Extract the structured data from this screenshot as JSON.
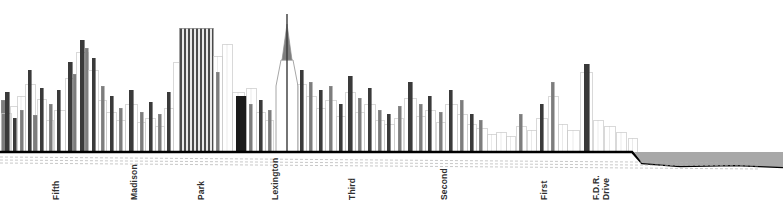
{
  "figure": {
    "width": 783,
    "height": 221,
    "background_color": "#ffffff"
  },
  "colors": {
    "outline_light": "#c9c9c9",
    "outline_mid": "#8f8f8f",
    "fill_dark": "#3a3a3a",
    "fill_black": "#1a1a1a",
    "fill_mid_gray": "#7d7d7d",
    "fill_light_gray": "#d6d6d6",
    "ground_line": "#000000",
    "water_fill": "#a8a8a8",
    "dashed_line": "#b0b0b0",
    "label_text": "#303030"
  },
  "ground": {
    "baseline_y": 152,
    "label_y": 200,
    "water_top_y": 152,
    "water_start_x": 640
  },
  "street_labels": [
    {
      "name": "Fifth",
      "lines": [
        "Fifth"
      ],
      "x": 52,
      "y": 200
    },
    {
      "name": "Madison",
      "lines": [
        "Madison"
      ],
      "x": 130,
      "y": 200
    },
    {
      "name": "Park",
      "lines": [
        "Park"
      ],
      "x": 197,
      "y": 200
    },
    {
      "name": "Lexington",
      "lines": [
        "Lexington"
      ],
      "x": 271,
      "y": 200
    },
    {
      "name": "Third",
      "lines": [
        "Third"
      ],
      "x": 348,
      "y": 200
    },
    {
      "name": "Second",
      "lines": [
        "Second"
      ],
      "x": 440,
      "y": 200
    },
    {
      "name": "First",
      "lines": [
        "First"
      ],
      "x": 540,
      "y": 200
    },
    {
      "name": "F.D.R. Drive",
      "lines": [
        "F.D.R.",
        "Drive"
      ],
      "x": 592,
      "y": 200
    }
  ],
  "chart_data": {
    "type": "bar",
    "subtitle": "Building heights along an east-west section from Fifth Avenue to the East River",
    "xlabel": "Avenue (west to east)",
    "ylabel": "Building height",
    "orientation": "vertical",
    "grid": false,
    "legend": null,
    "xlim": [
      0,
      783
    ],
    "ylim": [
      0,
      152
    ],
    "baseline_y": 152,
    "categories": [
      "Fifth",
      "Madison",
      "Park",
      "Lexington",
      "Third",
      "Second",
      "First",
      "F.D.R. Drive"
    ],
    "category_x": [
      52,
      130,
      197,
      271,
      348,
      440,
      540,
      592
    ],
    "annotations": [
      {
        "label": "East River",
        "x_start": 640,
        "x_end": 783,
        "y_top": 152,
        "fill": "#a8a8a8"
      },
      {
        "label": "Chrysler Building spire",
        "x": 287,
        "peak_y": 14
      },
      {
        "label": "MetLife / Pan Am striped tower",
        "x": 196,
        "peak_y": 28
      }
    ],
    "buildings": [
      {
        "x": 1,
        "w": 5,
        "top": 100,
        "tone": "mid"
      },
      {
        "x": 1,
        "w": 10,
        "top": 113,
        "tone": "light"
      },
      {
        "x": 5,
        "w": 4,
        "top": 92,
        "tone": "dark"
      },
      {
        "x": 10,
        "w": 7,
        "top": 106,
        "tone": "light"
      },
      {
        "x": 13,
        "w": 3,
        "top": 118,
        "tone": "dark"
      },
      {
        "x": 17,
        "w": 8,
        "top": 96,
        "tone": "light"
      },
      {
        "x": 20,
        "w": 3,
        "top": 110,
        "tone": "mid"
      },
      {
        "x": 25,
        "w": 10,
        "top": 84,
        "tone": "light"
      },
      {
        "x": 28,
        "w": 3,
        "top": 70,
        "tone": "dark"
      },
      {
        "x": 33,
        "w": 4,
        "top": 115,
        "tone": "mid"
      },
      {
        "x": 37,
        "w": 9,
        "top": 99,
        "tone": "light"
      },
      {
        "x": 40,
        "w": 3,
        "top": 88,
        "tone": "dark"
      },
      {
        "x": 46,
        "w": 7,
        "top": 120,
        "tone": "light"
      },
      {
        "x": 49,
        "w": 3,
        "top": 104,
        "tone": "mid"
      },
      {
        "x": 54,
        "w": 11,
        "top": 110,
        "tone": "light"
      },
      {
        "x": 57,
        "w": 3,
        "top": 90,
        "tone": "dark"
      },
      {
        "x": 65,
        "w": 9,
        "top": 78,
        "tone": "light"
      },
      {
        "x": 68,
        "w": 4,
        "top": 62,
        "tone": "dark"
      },
      {
        "x": 73,
        "w": 3,
        "top": 74,
        "tone": "mid"
      },
      {
        "x": 76,
        "w": 12,
        "top": 52,
        "tone": "light"
      },
      {
        "x": 80,
        "w": 4,
        "top": 40,
        "tone": "dark"
      },
      {
        "x": 85,
        "w": 3,
        "top": 48,
        "tone": "mid"
      },
      {
        "x": 88,
        "w": 10,
        "top": 70,
        "tone": "light"
      },
      {
        "x": 92,
        "w": 3,
        "top": 58,
        "tone": "dark"
      },
      {
        "x": 98,
        "w": 8,
        "top": 100,
        "tone": "light"
      },
      {
        "x": 101,
        "w": 3,
        "top": 86,
        "tone": "mid"
      },
      {
        "x": 106,
        "w": 10,
        "top": 112,
        "tone": "light"
      },
      {
        "x": 110,
        "w": 3,
        "top": 96,
        "tone": "dark"
      },
      {
        "x": 116,
        "w": 9,
        "top": 120,
        "tone": "light"
      },
      {
        "x": 119,
        "w": 3,
        "top": 108,
        "tone": "mid"
      },
      {
        "x": 125,
        "w": 12,
        "top": 104,
        "tone": "light"
      },
      {
        "x": 129,
        "w": 4,
        "top": 90,
        "tone": "dark"
      },
      {
        "x": 137,
        "w": 8,
        "top": 122,
        "tone": "light"
      },
      {
        "x": 140,
        "w": 3,
        "top": 112,
        "tone": "mid"
      },
      {
        "x": 145,
        "w": 10,
        "top": 118,
        "tone": "light"
      },
      {
        "x": 149,
        "w": 3,
        "top": 102,
        "tone": "dark"
      },
      {
        "x": 155,
        "w": 9,
        "top": 126,
        "tone": "light"
      },
      {
        "x": 158,
        "w": 3,
        "top": 114,
        "tone": "mid"
      },
      {
        "x": 164,
        "w": 9,
        "top": 108,
        "tone": "light"
      },
      {
        "x": 167,
        "w": 3,
        "top": 92,
        "tone": "dark"
      },
      {
        "x": 173,
        "w": 6,
        "top": 62,
        "tone": "light"
      },
      {
        "x": 179,
        "w": 34,
        "top": 28,
        "tone": "striped"
      },
      {
        "x": 213,
        "w": 9,
        "top": 56,
        "tone": "light"
      },
      {
        "x": 216,
        "w": 3,
        "top": 72,
        "tone": "mid"
      },
      {
        "x": 222,
        "w": 10,
        "top": 44,
        "tone": "light"
      },
      {
        "x": 232,
        "w": 12,
        "top": 92,
        "tone": "light"
      },
      {
        "x": 236,
        "w": 10,
        "top": 96,
        "tone": "black"
      },
      {
        "x": 246,
        "w": 10,
        "top": 88,
        "tone": "light"
      },
      {
        "x": 249,
        "w": 3,
        "top": 104,
        "tone": "mid"
      },
      {
        "x": 256,
        "w": 9,
        "top": 112,
        "tone": "light"
      },
      {
        "x": 259,
        "w": 3,
        "top": 100,
        "tone": "dark"
      },
      {
        "x": 265,
        "w": 8,
        "top": 120,
        "tone": "light"
      },
      {
        "x": 268,
        "w": 3,
        "top": 110,
        "tone": "mid"
      },
      {
        "x": 297,
        "w": 9,
        "top": 84,
        "tone": "light"
      },
      {
        "x": 300,
        "w": 3,
        "top": 70,
        "tone": "dark"
      },
      {
        "x": 306,
        "w": 10,
        "top": 96,
        "tone": "light"
      },
      {
        "x": 309,
        "w": 3,
        "top": 82,
        "tone": "mid"
      },
      {
        "x": 316,
        "w": 9,
        "top": 108,
        "tone": "light"
      },
      {
        "x": 319,
        "w": 3,
        "top": 90,
        "tone": "dark"
      },
      {
        "x": 325,
        "w": 11,
        "top": 100,
        "tone": "light"
      },
      {
        "x": 329,
        "w": 3,
        "top": 86,
        "tone": "mid"
      },
      {
        "x": 336,
        "w": 9,
        "top": 116,
        "tone": "light"
      },
      {
        "x": 339,
        "w": 3,
        "top": 104,
        "tone": "dark"
      },
      {
        "x": 345,
        "w": 10,
        "top": 92,
        "tone": "light"
      },
      {
        "x": 348,
        "w": 4,
        "top": 76,
        "tone": "dark"
      },
      {
        "x": 355,
        "w": 9,
        "top": 112,
        "tone": "light"
      },
      {
        "x": 358,
        "w": 3,
        "top": 98,
        "tone": "mid"
      },
      {
        "x": 364,
        "w": 11,
        "top": 104,
        "tone": "light"
      },
      {
        "x": 368,
        "w": 3,
        "top": 88,
        "tone": "dark"
      },
      {
        "x": 375,
        "w": 9,
        "top": 120,
        "tone": "light"
      },
      {
        "x": 378,
        "w": 3,
        "top": 110,
        "tone": "mid"
      },
      {
        "x": 384,
        "w": 10,
        "top": 124,
        "tone": "light"
      },
      {
        "x": 387,
        "w": 3,
        "top": 114,
        "tone": "dark"
      },
      {
        "x": 394,
        "w": 9,
        "top": 118,
        "tone": "light"
      },
      {
        "x": 398,
        "w": 3,
        "top": 106,
        "tone": "mid"
      },
      {
        "x": 404,
        "w": 12,
        "top": 98,
        "tone": "light"
      },
      {
        "x": 408,
        "w": 4,
        "top": 82,
        "tone": "dark"
      },
      {
        "x": 416,
        "w": 9,
        "top": 116,
        "tone": "light"
      },
      {
        "x": 419,
        "w": 3,
        "top": 104,
        "tone": "mid"
      },
      {
        "x": 425,
        "w": 10,
        "top": 110,
        "tone": "light"
      },
      {
        "x": 428,
        "w": 3,
        "top": 96,
        "tone": "dark"
      },
      {
        "x": 436,
        "w": 9,
        "top": 122,
        "tone": "light"
      },
      {
        "x": 439,
        "w": 3,
        "top": 112,
        "tone": "mid"
      },
      {
        "x": 445,
        "w": 12,
        "top": 104,
        "tone": "light"
      },
      {
        "x": 449,
        "w": 3,
        "top": 90,
        "tone": "dark"
      },
      {
        "x": 457,
        "w": 10,
        "top": 114,
        "tone": "light"
      },
      {
        "x": 460,
        "w": 3,
        "top": 100,
        "tone": "mid"
      },
      {
        "x": 467,
        "w": 9,
        "top": 124,
        "tone": "light"
      },
      {
        "x": 470,
        "w": 3,
        "top": 114,
        "tone": "dark"
      },
      {
        "x": 476,
        "w": 11,
        "top": 128,
        "tone": "light"
      },
      {
        "x": 479,
        "w": 3,
        "top": 120,
        "tone": "mid"
      },
      {
        "x": 487,
        "w": 9,
        "top": 134,
        "tone": "light"
      },
      {
        "x": 496,
        "w": 10,
        "top": 132,
        "tone": "light"
      },
      {
        "x": 506,
        "w": 9,
        "top": 136,
        "tone": "light"
      },
      {
        "x": 516,
        "w": 10,
        "top": 126,
        "tone": "light"
      },
      {
        "x": 519,
        "w": 3,
        "top": 114,
        "tone": "mid"
      },
      {
        "x": 527,
        "w": 9,
        "top": 130,
        "tone": "light"
      },
      {
        "x": 536,
        "w": 11,
        "top": 118,
        "tone": "light"
      },
      {
        "x": 540,
        "w": 3,
        "top": 104,
        "tone": "dark"
      },
      {
        "x": 548,
        "w": 10,
        "top": 96,
        "tone": "light"
      },
      {
        "x": 551,
        "w": 3,
        "top": 82,
        "tone": "mid"
      },
      {
        "x": 558,
        "w": 9,
        "top": 124,
        "tone": "light"
      },
      {
        "x": 567,
        "w": 12,
        "top": 130,
        "tone": "light"
      },
      {
        "x": 580,
        "w": 12,
        "top": 72,
        "tone": "light"
      },
      {
        "x": 584,
        "w": 5,
        "top": 64,
        "tone": "dark"
      },
      {
        "x": 593,
        "w": 10,
        "top": 120,
        "tone": "light"
      },
      {
        "x": 604,
        "w": 11,
        "top": 126,
        "tone": "light"
      },
      {
        "x": 616,
        "w": 10,
        "top": 132,
        "tone": "light"
      },
      {
        "x": 628,
        "w": 9,
        "top": 138,
        "tone": "light"
      }
    ],
    "spire": {
      "label": "Chrysler Building",
      "base_x": 276,
      "base_w": 22,
      "shaft_top": 60,
      "needle_x": 287,
      "needle_top": 14
    }
  }
}
